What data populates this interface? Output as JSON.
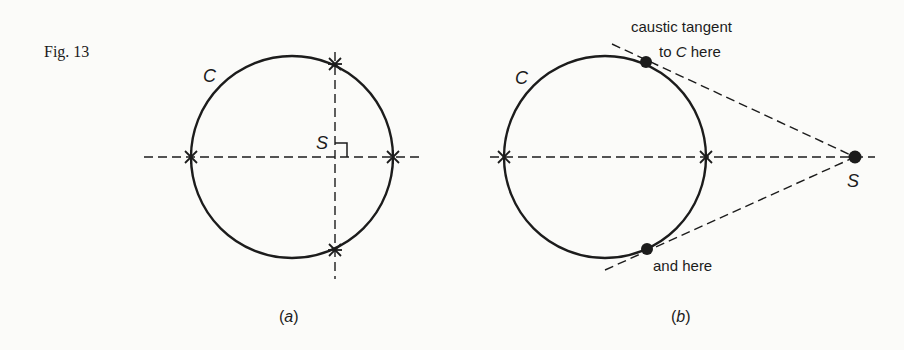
{
  "figure": {
    "label": "Fig. 13",
    "panels": [
      {
        "id": "a",
        "caption_open": "(",
        "caption_letter": "a",
        "caption_close": ")",
        "curve_label": "C",
        "source_label": "S",
        "description": "Circle C with point S inside; two perpendicular dashed lines through S meet C at four marked points"
      },
      {
        "id": "b",
        "caption_open": "(",
        "caption_letter": "b",
        "caption_close": ")",
        "curve_label": "C",
        "source_label": "S",
        "annotation_top_line1": "caustic tangent",
        "annotation_top_line2_prefix": "to ",
        "annotation_top_line2_italic": "C",
        "annotation_top_line2_suffix": " here",
        "annotation_bottom": "and here",
        "description": "Circle C with point S outside; dashed tangents from S touch C at two dotted points"
      }
    ]
  },
  "colors": {
    "ink": "#1c1c1c",
    "paper": "#fbfbf9"
  }
}
